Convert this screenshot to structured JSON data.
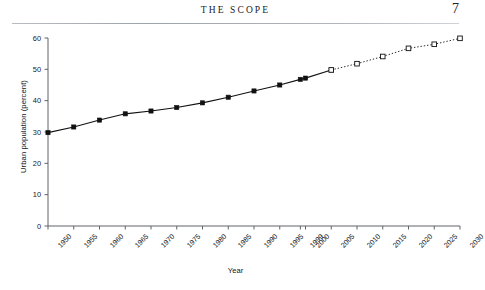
{
  "page": {
    "running_head": "The Scope",
    "page_number": "7"
  },
  "chart_data": {
    "type": "line",
    "title": "",
    "xlabel": "Year",
    "ylabel": "Urban population (percent)",
    "xlim": [
      1950,
      2030
    ],
    "ylim": [
      0,
      60
    ],
    "ytick_labels": [
      "0",
      "10",
      "20",
      "30",
      "40",
      "50",
      "60"
    ],
    "ytick_values": [
      0,
      10,
      20,
      30,
      40,
      50,
      60
    ],
    "xtick_labels": [
      "1950",
      "1955",
      "1960",
      "1965",
      "1970",
      "1975",
      "1980",
      "1985",
      "1990",
      "1995",
      "1999",
      "2000",
      "2005",
      "2010",
      "2015",
      "2020",
      "2025",
      "2030"
    ],
    "xtick_values": [
      1950,
      1955,
      1960,
      1965,
      1970,
      1975,
      1980,
      1985,
      1990,
      1995,
      1999,
      2000,
      2005,
      2010,
      2015,
      2020,
      2025,
      2030
    ],
    "grid": false,
    "legend": "none",
    "series": [
      {
        "name": "Observed urban population",
        "style": "solid",
        "marker": "filled-square",
        "color": "#111111",
        "x": [
          1950,
          1955,
          1960,
          1965,
          1970,
          1975,
          1980,
          1985,
          1990,
          1995,
          1999,
          2000,
          2005
        ],
        "values": [
          29.8,
          31.6,
          33.8,
          35.8,
          36.7,
          37.8,
          39.3,
          41.1,
          43.1,
          45.0,
          46.8,
          47.2,
          49.8
        ]
      },
      {
        "name": "Projected urban population",
        "style": "dotted",
        "marker": "open-square",
        "color": "#111111",
        "x": [
          2005,
          2010,
          2015,
          2020,
          2025,
          2030
        ],
        "values": [
          49.8,
          51.8,
          54.1,
          56.7,
          58.0,
          59.9
        ]
      }
    ]
  }
}
